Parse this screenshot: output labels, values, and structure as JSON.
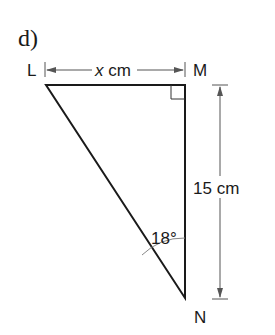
{
  "part_label": "d)",
  "vertices": {
    "L": "L",
    "M": "M",
    "N": "N"
  },
  "dimensions": {
    "top": {
      "var": "x",
      "unit": "cm"
    },
    "right": "15 cm"
  },
  "angle": "18°",
  "colors": {
    "line": "#1a1a1a",
    "dim": "#555555"
  }
}
